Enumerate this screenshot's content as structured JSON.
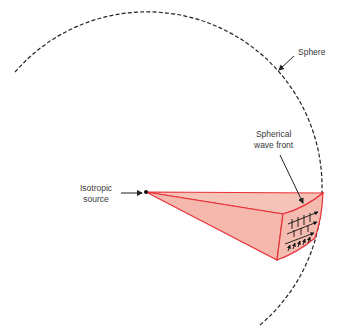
{
  "diagram": {
    "labels": {
      "sphere": "Sphere",
      "wave_front_line1": "Spherical",
      "wave_front_line2": "wave front",
      "source_line1": "Isotropic",
      "source_line2": "source"
    },
    "colors": {
      "wedge_fill": "#f4b8ac",
      "wedge_stroke": "#e8323a",
      "sphere_stroke": "#222222",
      "text": "#3a3a3a",
      "arrow": "#222222"
    }
  }
}
